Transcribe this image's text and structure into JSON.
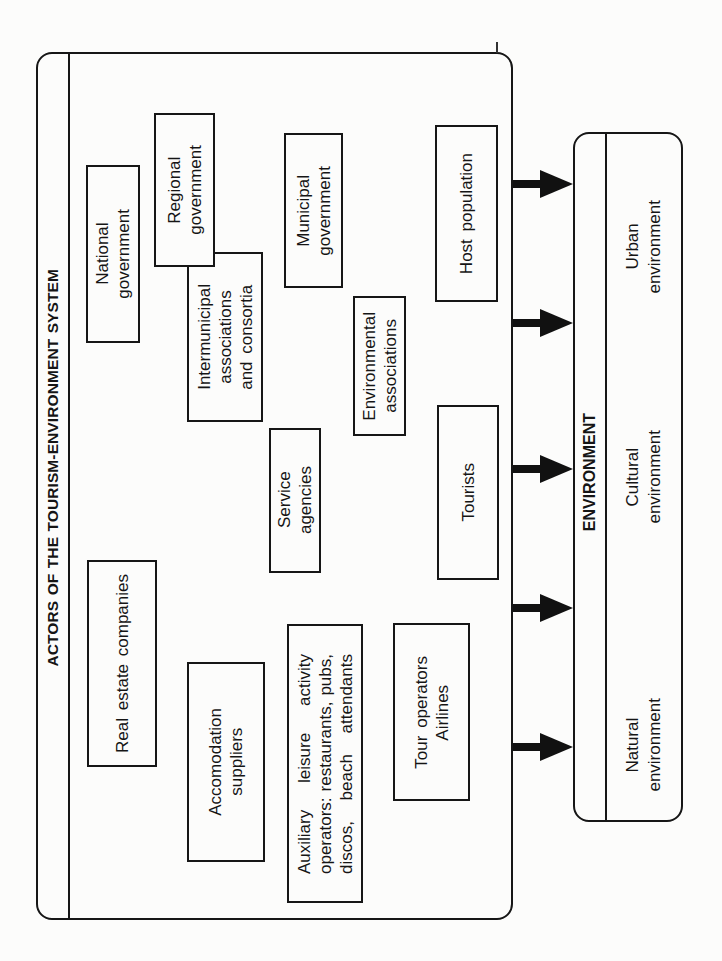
{
  "actors_panel": {
    "title": "ACTORS OF THE  TOURISM-ENVIRONMENT SYSTEM",
    "actors": [
      {
        "name": "National government",
        "lines": [
          "National",
          "government"
        ]
      },
      {
        "name": "Regional government",
        "lines": [
          "Regional",
          "government"
        ]
      },
      {
        "name": "Intermunicipal associations and consortia",
        "lines": [
          "Intermunicipal",
          "associations",
          "and  consortia"
        ]
      },
      {
        "name": "Municipal government",
        "lines": [
          "Municipal",
          "government"
        ]
      },
      {
        "name": "Environmental associations",
        "lines": [
          "Environmental",
          "associations"
        ]
      },
      {
        "name": "Host population",
        "lines": [
          "Host  population"
        ]
      },
      {
        "name": "Service agencies",
        "lines": [
          "Service",
          "agencies"
        ]
      },
      {
        "name": "Tourists",
        "lines": [
          "Tourists"
        ]
      },
      {
        "name": "Real estate companies",
        "lines": [
          "Real  estate  companies"
        ]
      },
      {
        "name": "Accomodation suppliers",
        "lines": [
          "Accomodation",
          "suppliers"
        ]
      },
      {
        "name": "Auxiliary leisure activity operators: restaurants, pubs, discos, beach attendants",
        "lines": [
          "Auxiliary leisure activity",
          "operators: restaurants, pubs,",
          "discos, beach attendants"
        ]
      },
      {
        "name": "Tour operators Airlines",
        "lines": [
          "Tour operators",
          "Airlines"
        ]
      }
    ]
  },
  "arrows": {
    "count": 5,
    "direction": "actors-to-environment",
    "color": "#111111"
  },
  "environment_panel": {
    "title": "ENVIRONMENT",
    "items": [
      {
        "name": "Urban environment",
        "lines": [
          "Urban",
          "environment"
        ]
      },
      {
        "name": "Cultural environment",
        "lines": [
          "Cultural",
          "environment"
        ]
      },
      {
        "name": "Natural environment",
        "lines": [
          "Natural",
          "environment"
        ]
      }
    ]
  }
}
